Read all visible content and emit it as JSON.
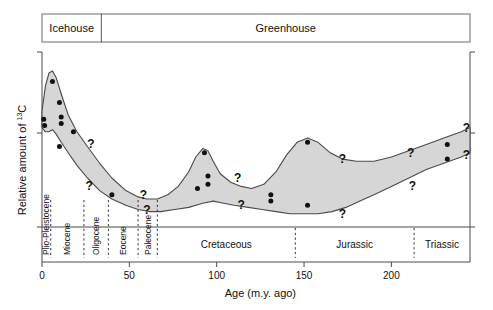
{
  "figure": {
    "climate_bands": [
      {
        "label": "Icehouse",
        "x_start_ma": 0,
        "x_end_ma": 34
      },
      {
        "label": "Greenhouse",
        "x_start_ma": 34,
        "x_end_ma": 245
      }
    ]
  },
  "chart_data": {
    "type": "area",
    "title": "",
    "xlabel": "Age (m.y. ago)",
    "ylabel": "Relative amount of 13C",
    "ylabel_parts": {
      "main": "Relative amount of ",
      "isotope_sup": "13",
      "element": "C"
    },
    "xlim": [
      0,
      245
    ],
    "ylim": [
      0,
      100
    ],
    "grid": false,
    "legend": null,
    "xticks": [
      0,
      50,
      100,
      150,
      200
    ],
    "xtick_labels": [
      "0",
      "50",
      "100",
      "150",
      "200"
    ],
    "yticks": [],
    "ytick_labels": [],
    "series": [
      {
        "name": "Upper bound of 13C envelope",
        "x": [
          0,
          2,
          4,
          6,
          8,
          11,
          15,
          20,
          26,
          33,
          40,
          48,
          55,
          60,
          66,
          72,
          78,
          84,
          88,
          92,
          95,
          98,
          102,
          108,
          114,
          120,
          127,
          134,
          140,
          146,
          152,
          158,
          165,
          172,
          180,
          190,
          200,
          210,
          220,
          230,
          240,
          245
        ],
        "y": [
          72,
          84,
          90,
          91,
          88,
          80,
          70,
          62,
          55,
          47,
          40,
          34,
          31,
          30,
          30,
          32,
          36,
          43,
          50,
          54,
          53,
          48,
          42,
          38,
          36,
          35,
          37,
          43,
          51,
          57,
          59,
          57,
          52,
          49,
          48,
          48,
          50,
          53,
          56,
          59,
          62,
          64
        ]
      },
      {
        "name": "Lower bound of 13C envelope",
        "x": [
          0,
          2,
          4,
          6,
          8,
          11,
          15,
          20,
          26,
          33,
          40,
          48,
          55,
          62,
          68,
          76,
          84,
          92,
          98,
          104,
          110,
          118,
          126,
          134,
          142,
          150,
          158,
          166,
          174,
          182,
          190,
          200,
          210,
          220,
          230,
          240,
          245
        ],
        "y": [
          64,
          62,
          62,
          63,
          61,
          57,
          52,
          46,
          40,
          34,
          30,
          27,
          25,
          24,
          24,
          25,
          26,
          28,
          29,
          28,
          27,
          26,
          25,
          24,
          23,
          23,
          23,
          24,
          26,
          29,
          32,
          36,
          40,
          44,
          47,
          50,
          52
        ]
      }
    ],
    "scatter_points": [
      {
        "x": 6,
        "y": 86
      },
      {
        "x": 1,
        "y": 68
      },
      {
        "x": 1.5,
        "y": 65
      },
      {
        "x": 10,
        "y": 76
      },
      {
        "x": 11,
        "y": 69
      },
      {
        "x": 11,
        "y": 66
      },
      {
        "x": 18,
        "y": 62
      },
      {
        "x": 10,
        "y": 55
      },
      {
        "x": 40,
        "y": 32
      },
      {
        "x": 93,
        "y": 52
      },
      {
        "x": 95,
        "y": 41
      },
      {
        "x": 95,
        "y": 37
      },
      {
        "x": 89,
        "y": 35
      },
      {
        "x": 131,
        "y": 32
      },
      {
        "x": 131,
        "y": 29
      },
      {
        "x": 152,
        "y": 57
      },
      {
        "x": 152,
        "y": 27
      },
      {
        "x": 232,
        "y": 56
      },
      {
        "x": 232,
        "y": 49
      }
    ],
    "annotations": [
      {
        "text": "?",
        "x": 28,
        "y": 56
      },
      {
        "text": "?",
        "x": 27,
        "y": 36
      },
      {
        "text": "?",
        "x": 58,
        "y": 32
      },
      {
        "text": "?",
        "x": 60,
        "y": 25
      },
      {
        "text": "?",
        "x": 112,
        "y": 40
      },
      {
        "text": "?",
        "x": 114,
        "y": 27
      },
      {
        "text": "?",
        "x": 172,
        "y": 49
      },
      {
        "text": "?",
        "x": 172,
        "y": 23
      },
      {
        "text": "?",
        "x": 211,
        "y": 52
      },
      {
        "text": "?",
        "x": 212,
        "y": 36
      },
      {
        "text": "?",
        "x": 243,
        "y": 64
      },
      {
        "text": "?",
        "x": 243,
        "y": 51
      }
    ],
    "epochs": [
      {
        "label": "Plio-Pleistocene",
        "start_ma": 0,
        "end_ma": 5
      },
      {
        "label": "Miocene",
        "start_ma": 5,
        "end_ma": 24
      },
      {
        "label": "Oligocene",
        "start_ma": 24,
        "end_ma": 38
      },
      {
        "label": "Eocene",
        "start_ma": 38,
        "end_ma": 55
      },
      {
        "label": "Paleocene",
        "start_ma": 55,
        "end_ma": 66
      }
    ],
    "periods": [
      {
        "label": "Cretaceous",
        "start_ma": 66,
        "end_ma": 145
      },
      {
        "label": "Jurassic",
        "start_ma": 145,
        "end_ma": 213
      },
      {
        "label": "Triassic",
        "start_ma": 213,
        "end_ma": 245
      }
    ],
    "colors": {
      "band_fill": "#d6d6d6",
      "band_stroke": "#4a4a4a",
      "axis": "#4a4a4a",
      "text": "#111111",
      "dot": "#111111"
    }
  }
}
